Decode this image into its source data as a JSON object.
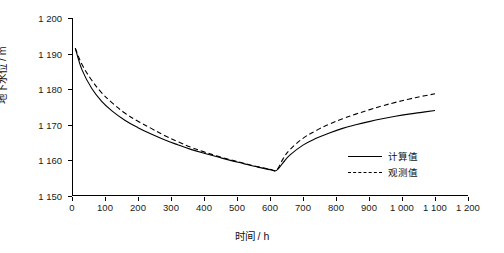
{
  "chart_data": {
    "type": "line",
    "title": "",
    "xlabel": "时间 / h",
    "ylabel": "地下水位 / m",
    "xlim": [
      0,
      1200
    ],
    "ylim": [
      1150,
      1200
    ],
    "grid": false,
    "legend_position": "right-inside",
    "x_ticks": [
      "0",
      "100",
      "200",
      "300",
      "400",
      "500",
      "600",
      "700",
      "800",
      "900",
      "1 000",
      "1 100",
      "1 200"
    ],
    "y_ticks": [
      "1 150",
      "1 160",
      "1 170",
      "1 180",
      "1 190",
      "1 200"
    ],
    "series": [
      {
        "name": "计算值",
        "style": "solid",
        "color": "#000000",
        "x": [
          10,
          30,
          60,
          90,
          120,
          160,
          200,
          240,
          280,
          320,
          360,
          400,
          440,
          480,
          520,
          560,
          600,
          620,
          640,
          660,
          700,
          740,
          780,
          820,
          860,
          900,
          940,
          980,
          1020,
          1060,
          1100
        ],
        "y": [
          1191.5,
          1185.5,
          1180.2,
          1176.6,
          1174.0,
          1171.3,
          1169.2,
          1167.4,
          1165.8,
          1164.4,
          1163.1,
          1162.0,
          1161.0,
          1160.0,
          1159.1,
          1158.2,
          1157.4,
          1157.2,
          1159.4,
          1161.5,
          1164.3,
          1166.2,
          1167.7,
          1169.0,
          1170.0,
          1170.9,
          1171.7,
          1172.4,
          1173.0,
          1173.5,
          1174.0
        ]
      },
      {
        "name": "观测值",
        "style": "dashed",
        "color": "#000000",
        "x": [
          10,
          30,
          60,
          90,
          120,
          160,
          200,
          240,
          280,
          320,
          360,
          400,
          440,
          480,
          520,
          560,
          600,
          620,
          640,
          660,
          700,
          740,
          780,
          820,
          860,
          900,
          940,
          980,
          1020,
          1060,
          1100
        ],
        "y": [
          1191.5,
          1187.0,
          1182.5,
          1179.0,
          1176.3,
          1173.3,
          1171.0,
          1169.0,
          1167.0,
          1165.3,
          1163.7,
          1162.4,
          1161.2,
          1160.2,
          1159.2,
          1158.3,
          1157.5,
          1157.3,
          1160.5,
          1163.0,
          1166.2,
          1168.4,
          1170.2,
          1171.7,
          1173.0,
          1174.2,
          1175.3,
          1176.3,
          1177.2,
          1178.0,
          1178.7
        ]
      }
    ]
  },
  "legend": {
    "items": [
      {
        "label": "计算值",
        "style": "solid"
      },
      {
        "label": "观测值",
        "style": "dashed"
      }
    ]
  }
}
